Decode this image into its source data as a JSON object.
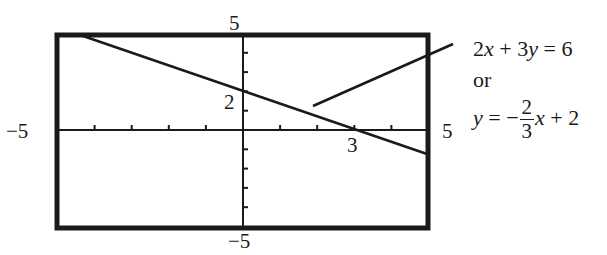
{
  "chart_data": {
    "type": "line",
    "title": "",
    "xlabel": "",
    "ylabel": "",
    "xlim": [
      -5,
      5
    ],
    "ylim": [
      -5,
      5
    ],
    "grid": false,
    "tick_step": 1,
    "series": [
      {
        "name": "2x + 3y = 6",
        "equation": "y = -2/3 x + 2",
        "x": [
          -4,
          5
        ],
        "y": [
          4.667,
          -1.333
        ]
      }
    ],
    "annotations": {
      "y_intercept": {
        "x": 0,
        "y": 2,
        "label": "2"
      },
      "x_intercept": {
        "x": 3,
        "y": 0,
        "label": "3"
      }
    },
    "tick_labels": {
      "x_min": "−5",
      "x_max": "5",
      "y_max": "5",
      "y_min": "−5"
    }
  },
  "labels": {
    "x_min": "−5",
    "x_max": "5",
    "y_max": "5",
    "y_min": "−5",
    "y_intercept": "2",
    "x_intercept": "3"
  },
  "equation": {
    "standard": {
      "a": "2",
      "x": "x",
      "plus": " + ",
      "b": "3",
      "y": "y",
      "eq": " = ",
      "c": "6"
    },
    "connector": "or",
    "slope_intercept": {
      "y": "y",
      "eq": " = −",
      "num": "2",
      "den": "3",
      "x": "x",
      "rest": " + 2"
    }
  },
  "colors": {
    "ink": "#1a1a1a",
    "background": "#ffffff"
  }
}
